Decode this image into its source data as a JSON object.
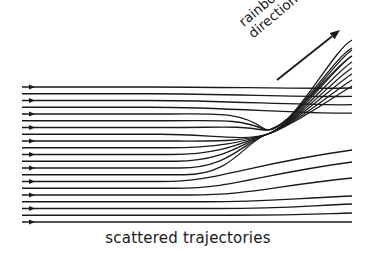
{
  "diagram": {
    "title": "scattered trajectories",
    "annotation": {
      "line1": "rainbow",
      "line2": "direction",
      "arrow": {
        "x1": 277,
        "y1": 80,
        "x2": 340,
        "y2": 30
      }
    },
    "colors": {
      "stroke": "#1a1a1a",
      "background": "#ffffff"
    },
    "rays": {
      "count": 21,
      "x_start": 22,
      "y_first": 87,
      "y_spacing": 6.75,
      "arrow_x": 32,
      "arrow_every": 2,
      "caustic_point": {
        "x": 268,
        "y": 136
      }
    }
  }
}
